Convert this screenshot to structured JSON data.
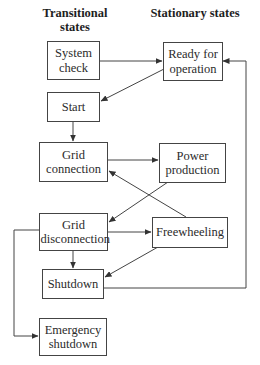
{
  "headers": {
    "transitional": "Transitional states",
    "stationary": "Stationary states"
  },
  "nodes": {
    "system_check": "System check",
    "ready_for_operation": "Ready for operation",
    "start": "Start",
    "grid_connection": "Grid connection",
    "power_production": "Power production",
    "grid_disconnection": "Grid disconnection",
    "freewheeling": "Freewheeling",
    "shutdown": "Shutdown",
    "emergency_shutdown": "Emergency shutdown"
  },
  "edges": [
    {
      "from": "System check",
      "to": "Ready for operation"
    },
    {
      "from": "Ready for operation",
      "to": "Start"
    },
    {
      "from": "Start",
      "to": "Grid connection"
    },
    {
      "from": "Grid connection",
      "to": "Power production"
    },
    {
      "from": "Power production",
      "to": "Grid disconnection"
    },
    {
      "from": "Freewheeling",
      "to": "Grid connection"
    },
    {
      "from": "Grid disconnection",
      "to": "Freewheeling"
    },
    {
      "from": "Grid disconnection",
      "to": "Shutdown"
    },
    {
      "from": "Freewheeling",
      "to": "Shutdown"
    },
    {
      "from": "Shutdown",
      "to": "Ready for operation"
    },
    {
      "from": "Grid disconnection",
      "to": "Emergency shutdown"
    }
  ],
  "colors": {
    "line": "#444444",
    "text": "#2b2b2b",
    "background": "#ffffff"
  }
}
